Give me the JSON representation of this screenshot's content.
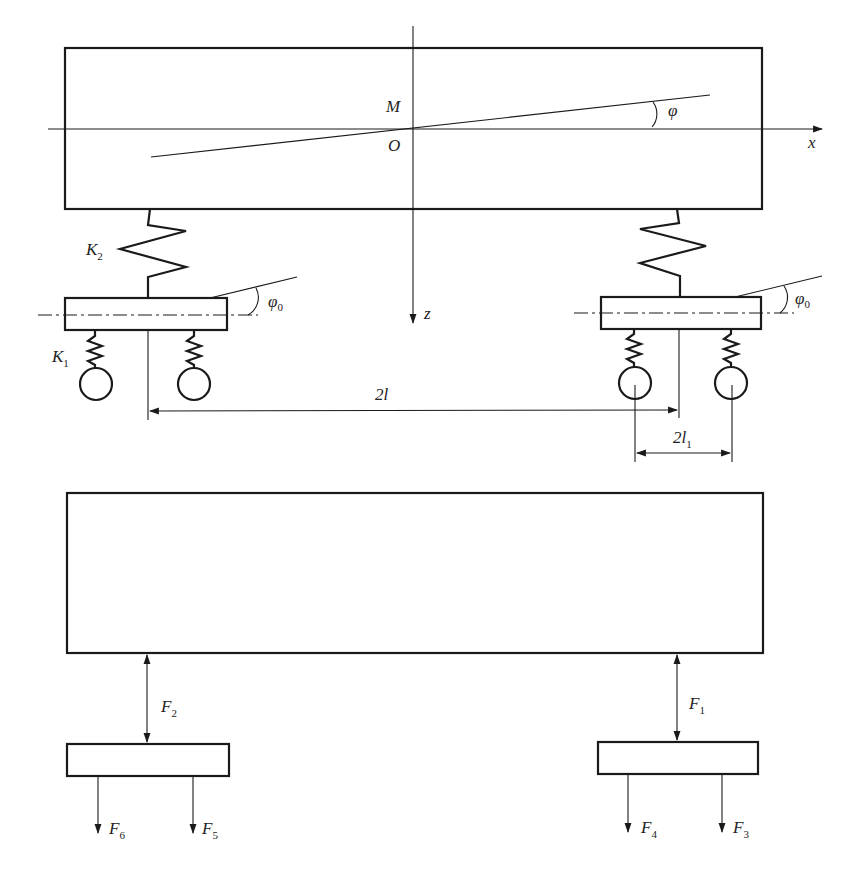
{
  "diagram": {
    "top_view": {
      "labels": {
        "M": "M",
        "O": "O",
        "phi": "φ",
        "x_axis": "x",
        "z_axis": "z",
        "K2": "K",
        "K2_sub": "2",
        "K1": "K",
        "K1_sub": "1",
        "phi0_left": "φ",
        "phi0_left_sub": "0",
        "phi0_right": "φ",
        "phi0_right_sub": "0",
        "dim_2l": "2l",
        "dim_2l1": "2l",
        "dim_2l1_sub": "1"
      }
    },
    "force_view": {
      "labels": {
        "F1": "F",
        "F1_sub": "1",
        "F2": "F",
        "F2_sub": "2",
        "F3": "F",
        "F3_sub": "3",
        "F4": "F",
        "F4_sub": "4",
        "F5": "F",
        "F5_sub": "5",
        "F6": "F",
        "F6_sub": "6"
      }
    },
    "colors": {
      "stroke": "#1a1a1a",
      "background": "#ffffff"
    }
  }
}
